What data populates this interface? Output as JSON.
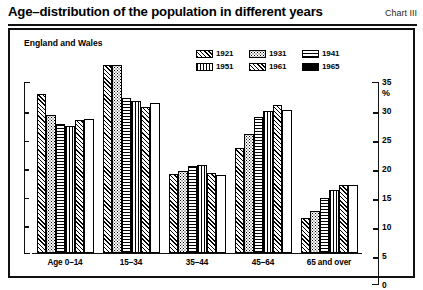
{
  "header": {
    "title": "Age–distribution of the population in different years",
    "chart_number": "Chart III"
  },
  "frame": {
    "subtitle": "England and Wales"
  },
  "legend": {
    "rows": [
      [
        {
          "label": "1921",
          "pattern": "diagonal-hatch"
        },
        {
          "label": "1931",
          "pattern": "stipple-dots"
        },
        {
          "label": "1941",
          "pattern": "horizontal-lines"
        }
      ],
      [
        {
          "label": "1951",
          "pattern": "vertical-lines"
        },
        {
          "label": "1961",
          "pattern": "cross-hatch"
        },
        {
          "label": "1965",
          "pattern": "solid-black"
        }
      ]
    ]
  },
  "axis": {
    "y_ticks": [
      "35",
      "30",
      "25",
      "20",
      "15",
      "10",
      "5",
      "0"
    ],
    "y_unit": "%"
  },
  "chart_data": {
    "type": "bar",
    "title": "Age–distribution of the population in different years",
    "subtitle": "England and Wales",
    "xlabel": "",
    "ylabel": "%",
    "ylim": [
      0,
      35
    ],
    "yticks": [
      0,
      5,
      10,
      15,
      20,
      25,
      30,
      35
    ],
    "grid": false,
    "legend_position": "top-right-inside",
    "categories": [
      "Age 0–14",
      "15–34",
      "35–44",
      "45–64",
      "65 and over"
    ],
    "series": [
      {
        "name": "1921",
        "pattern": "diagonal-hatch",
        "values": [
          27.7,
          32.8,
          13.8,
          18.3,
          6.0
        ]
      },
      {
        "name": "1931",
        "pattern": "stipple-dots",
        "values": [
          24.0,
          32.9,
          14.2,
          20.8,
          7.3
        ]
      },
      {
        "name": "1941",
        "pattern": "horizontal-lines",
        "values": [
          22.5,
          27.0,
          15.2,
          23.8,
          9.5
        ]
      },
      {
        "name": "1951",
        "pattern": "vertical-lines",
        "values": [
          22.2,
          26.5,
          15.3,
          24.7,
          10.9
        ]
      },
      {
        "name": "1961",
        "pattern": "cross-hatch",
        "values": [
          23.2,
          25.4,
          14.0,
          25.8,
          11.9
        ]
      },
      {
        "name": "1965",
        "pattern": "solid-black",
        "values": [
          23.3,
          26.1,
          13.5,
          24.9,
          11.9
        ]
      }
    ]
  }
}
